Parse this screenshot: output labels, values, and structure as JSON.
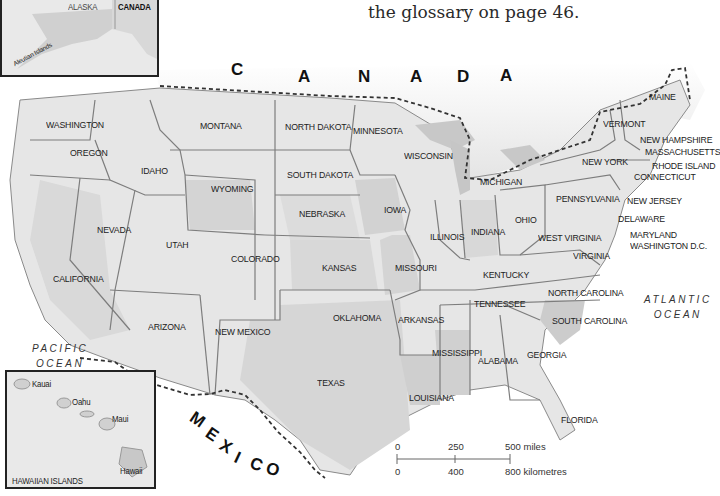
{
  "caption": {
    "text": "the glossary on page 46.",
    "partial_top": ""
  },
  "countries": {
    "canada": [
      "C",
      "A",
      "N",
      "A",
      "D",
      "A"
    ],
    "mexico": [
      "M",
      "E",
      "X",
      "I",
      "C",
      "O"
    ]
  },
  "oceans": {
    "pacific": {
      "line1": "PACIFIC",
      "line2": "OCEAN"
    },
    "atlantic": {
      "line1": "ATLANTIC",
      "line2": "OCEAN"
    }
  },
  "alaska_inset": {
    "alaska": "ALASKA",
    "canada": "CANADA",
    "aleutian": "Aleutian Islands"
  },
  "hawaii_inset": {
    "title": "HAWAIIAN ISLANDS",
    "islands": [
      "Kauai",
      "Oahu",
      "Maui",
      "Hawaii"
    ]
  },
  "states": [
    {
      "name": "WASHINGTON",
      "x": 46,
      "y": 119
    },
    {
      "name": "OREGON",
      "x": 70,
      "y": 147
    },
    {
      "name": "IDAHO",
      "x": 141,
      "y": 165
    },
    {
      "name": "MONTANA",
      "x": 200,
      "y": 120
    },
    {
      "name": "WYOMING",
      "x": 211,
      "y": 183
    },
    {
      "name": "NORTH DAKOTA",
      "x": 285,
      "y": 121
    },
    {
      "name": "SOUTH DAKOTA",
      "x": 287,
      "y": 169
    },
    {
      "name": "MINNESOTA",
      "x": 353,
      "y": 125
    },
    {
      "name": "WISCONSIN",
      "x": 404,
      "y": 150
    },
    {
      "name": "MICHIGAN",
      "x": 480,
      "y": 176
    },
    {
      "name": "NEBRASKA",
      "x": 299,
      "y": 208
    },
    {
      "name": "IOWA",
      "x": 384,
      "y": 204
    },
    {
      "name": "NEVADA",
      "x": 97,
      "y": 224
    },
    {
      "name": "UTAH",
      "x": 166,
      "y": 239
    },
    {
      "name": "COLORADO",
      "x": 231,
      "y": 253
    },
    {
      "name": "CALIFORNIA",
      "x": 53,
      "y": 273
    },
    {
      "name": "KANSAS",
      "x": 322,
      "y": 262
    },
    {
      "name": "MISSOURI",
      "x": 395,
      "y": 262
    },
    {
      "name": "ILLINOIS",
      "x": 430,
      "y": 231
    },
    {
      "name": "INDIANA",
      "x": 471,
      "y": 226
    },
    {
      "name": "OHIO",
      "x": 515,
      "y": 214
    },
    {
      "name": "WEST VIRGINIA",
      "x": 538,
      "y": 232
    },
    {
      "name": "KENTUCKY",
      "x": 483,
      "y": 269
    },
    {
      "name": "VIRGINIA",
      "x": 573,
      "y": 250
    },
    {
      "name": "PENNSYLVANIA",
      "x": 556,
      "y": 193
    },
    {
      "name": "NEW YORK",
      "x": 582,
      "y": 156
    },
    {
      "name": "VERMONT",
      "x": 603,
      "y": 118
    },
    {
      "name": "MAINE",
      "x": 649,
      "y": 91
    },
    {
      "name": "NEW HAMPSHIRE",
      "x": 640,
      "y": 134
    },
    {
      "name": "MASSACHUSETTS",
      "x": 645,
      "y": 146
    },
    {
      "name": "RHODE ISLAND",
      "x": 652,
      "y": 160
    },
    {
      "name": "CONNECTICUT",
      "x": 634,
      "y": 171
    },
    {
      "name": "NEW JERSEY",
      "x": 627,
      "y": 195
    },
    {
      "name": "DELAWARE",
      "x": 618,
      "y": 213
    },
    {
      "name": "MARYLAND",
      "x": 630,
      "y": 229
    },
    {
      "name": "WASHINGTON D.C.",
      "x": 630,
      "y": 240
    },
    {
      "name": "ARIZONA",
      "x": 148,
      "y": 321
    },
    {
      "name": "NEW MEXICO",
      "x": 215,
      "y": 326
    },
    {
      "name": "OKLAHOMA",
      "x": 333,
      "y": 312
    },
    {
      "name": "ARKANSAS",
      "x": 398,
      "y": 314
    },
    {
      "name": "TENNESSEE",
      "x": 474,
      "y": 298
    },
    {
      "name": "NORTH CAROLINA",
      "x": 548,
      "y": 287
    },
    {
      "name": "SOUTH CAROLINA",
      "x": 552,
      "y": 315
    },
    {
      "name": "MISSISSIPPI",
      "x": 432,
      "y": 347
    },
    {
      "name": "ALABAMA",
      "x": 478,
      "y": 355
    },
    {
      "name": "GEORGIA",
      "x": 527,
      "y": 349
    },
    {
      "name": "TEXAS",
      "x": 317,
      "y": 377
    },
    {
      "name": "LOUISIANA",
      "x": 409,
      "y": 392
    },
    {
      "name": "FLORIDA",
      "x": 561,
      "y": 414
    }
  ],
  "scale_bar": {
    "miles": [
      "0",
      "250",
      "500 miles"
    ],
    "kilometres": [
      "0",
      "400",
      "800 kilometres"
    ]
  }
}
